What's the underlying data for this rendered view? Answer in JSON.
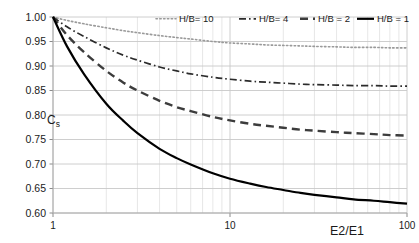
{
  "chart_data": {
    "type": "line",
    "title": "",
    "xlabel": "E2/E1",
    "ylabel": "Cs",
    "ylabel_base": "C",
    "ylabel_sub": "s",
    "xscale": "log",
    "xlim": [
      1,
      100
    ],
    "ylim": [
      0.6,
      1.0
    ],
    "xticks": [
      1,
      10,
      100
    ],
    "xtick_labels": [
      "1",
      "10",
      "100"
    ],
    "yticks": [
      0.6,
      0.65,
      0.7,
      0.75,
      0.8,
      0.85,
      0.9,
      0.95,
      1.0
    ],
    "ytick_labels": [
      "0.60",
      "0.65",
      "0.70",
      "0.75",
      "0.80",
      "0.85",
      "0.90",
      "0.95",
      "1.00"
    ],
    "grid": true,
    "grid_color": "#c8c8c8",
    "minor_grid_color": "#dcdcdc",
    "legend_position": "top-right",
    "series": [
      {
        "name": "H/B= 10",
        "style": "dotted",
        "color": "#9a9a9a",
        "width": 1.6,
        "dasharray": "1.4,2.4",
        "x": [
          1,
          1.2,
          1.5,
          2,
          2.5,
          3,
          4,
          5,
          6,
          8,
          10,
          13,
          16,
          20,
          25,
          30,
          40,
          50,
          65,
          80,
          100
        ],
        "y": [
          1.0,
          0.993,
          0.986,
          0.978,
          0.972,
          0.968,
          0.962,
          0.958,
          0.955,
          0.95,
          0.947,
          0.945,
          0.943,
          0.942,
          0.941,
          0.94,
          0.939,
          0.938,
          0.938,
          0.937,
          0.937
        ]
      },
      {
        "name": "H/B= 4",
        "style": "dash-dot",
        "color": "#2b2b2b",
        "width": 1.7,
        "dasharray": "7,3,1.6,3",
        "x": [
          1,
          1.2,
          1.5,
          2,
          2.5,
          3,
          4,
          5,
          6,
          8,
          10,
          13,
          16,
          20,
          25,
          30,
          40,
          50,
          65,
          80,
          100
        ],
        "y": [
          1.0,
          0.98,
          0.96,
          0.937,
          0.922,
          0.912,
          0.898,
          0.89,
          0.884,
          0.877,
          0.873,
          0.869,
          0.867,
          0.865,
          0.863,
          0.862,
          0.861,
          0.86,
          0.86,
          0.859,
          0.859
        ]
      },
      {
        "name": "H/B = 2",
        "style": "dashed",
        "color": "#3c3c3c",
        "width": 2.4,
        "dasharray": "8,5",
        "x": [
          1,
          1.2,
          1.5,
          2,
          2.5,
          3,
          4,
          5,
          6,
          8,
          10,
          13,
          16,
          20,
          25,
          30,
          40,
          50,
          65,
          80,
          100
        ],
        "y": [
          1.0,
          0.963,
          0.928,
          0.89,
          0.866,
          0.85,
          0.829,
          0.816,
          0.808,
          0.796,
          0.789,
          0.782,
          0.778,
          0.774,
          0.77,
          0.768,
          0.765,
          0.763,
          0.761,
          0.759,
          0.758
        ]
      },
      {
        "name": "H/B = 1",
        "style": "solid",
        "color": "#000000",
        "width": 2.2,
        "dasharray": "",
        "x": [
          1,
          1.2,
          1.5,
          2,
          2.5,
          3,
          4,
          5,
          6,
          8,
          10,
          13,
          16,
          20,
          25,
          30,
          40,
          50,
          65,
          80,
          100
        ],
        "y": [
          1.0,
          0.94,
          0.883,
          0.823,
          0.788,
          0.763,
          0.731,
          0.712,
          0.699,
          0.681,
          0.67,
          0.66,
          0.653,
          0.647,
          0.641,
          0.637,
          0.632,
          0.628,
          0.625,
          0.622,
          0.619
        ]
      }
    ]
  },
  "legend": {
    "items": [
      {
        "label": "H/B= 10"
      },
      {
        "label": "H/B= 4"
      },
      {
        "label": "H/B = 2"
      },
      {
        "label": "H/B = 1"
      }
    ]
  },
  "axes": {
    "x_axis_title": "E2/E1",
    "y_axis_label_base": "C",
    "y_axis_label_sub": "s"
  }
}
